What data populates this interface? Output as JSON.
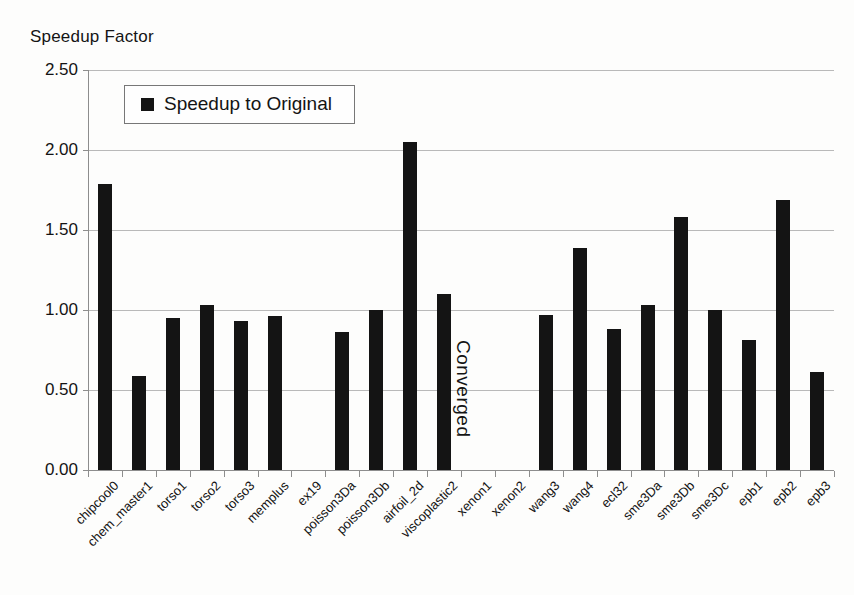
{
  "chart_data": {
    "type": "bar",
    "title": "",
    "ylabel": "Speedup Factor",
    "xlabel": "",
    "ylim": [
      0,
      2.5
    ],
    "ytick_labels": [
      "0.00",
      "0.50",
      "1.00",
      "1.50",
      "2.00",
      "2.50"
    ],
    "ytick_values": [
      0,
      0.5,
      1.0,
      1.5,
      2.0,
      2.5
    ],
    "grid": true,
    "legend_position": "top-left-inside",
    "categories": [
      "chipcool0",
      "chem_master1",
      "torso1",
      "torso2",
      "torso3",
      "memplus",
      "ex19",
      "poisson3Da",
      "poisson3Db",
      "airfoil_2d",
      "viscoplastic2",
      "xenon1",
      "xenon2",
      "wang3",
      "wang4",
      "ecl32",
      "sme3Da",
      "sme3Db",
      "sme3Dc",
      "epb1",
      "epb2",
      "epb3"
    ],
    "series": [
      {
        "name": "Speedup to Original",
        "color": "#141414",
        "values": [
          1.79,
          0.59,
          0.95,
          1.03,
          0.93,
          0.96,
          null,
          0.86,
          1.0,
          2.05,
          1.1,
          null,
          null,
          0.97,
          1.39,
          0.88,
          1.03,
          1.58,
          1.0,
          0.81,
          1.69,
          0.61
        ]
      }
    ],
    "annotations": [
      {
        "text": "Converged",
        "orientation": "vertical",
        "near_category": "xenon1"
      }
    ]
  },
  "legend": {
    "entries": [
      {
        "label": "Speedup to Original",
        "color": "#141414"
      }
    ]
  }
}
